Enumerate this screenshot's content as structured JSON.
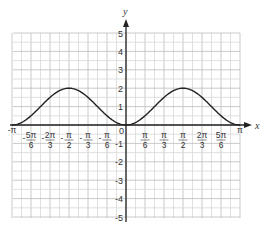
{
  "chart_data": {
    "type": "line",
    "title": "",
    "xlabel": "x",
    "ylabel": "y",
    "function": "y = 1 - cos(2x)",
    "xlim": [
      -3.14159,
      3.14159
    ],
    "ylim": [
      -5,
      5
    ],
    "grid": true,
    "x_ticks": [
      {
        "value": -3.14159,
        "label": "-π"
      },
      {
        "value": -2.61799,
        "label": "-5π/6",
        "num": "5π",
        "den": "6"
      },
      {
        "value": -2.0944,
        "label": "-2π/3",
        "num": "2π",
        "den": "3"
      },
      {
        "value": -1.5708,
        "label": "-π/2",
        "num": "π",
        "den": "2"
      },
      {
        "value": -1.0472,
        "label": "-π/3",
        "num": "π",
        "den": "3"
      },
      {
        "value": -0.5236,
        "label": "-π/6",
        "num": "π",
        "den": "6"
      },
      {
        "value": 0.5236,
        "label": "π/6",
        "num": "π",
        "den": "6"
      },
      {
        "value": 1.0472,
        "label": "π/3",
        "num": "π",
        "den": "3"
      },
      {
        "value": 1.5708,
        "label": "π/2",
        "num": "π",
        "den": "2"
      },
      {
        "value": 2.0944,
        "label": "2π/3",
        "num": "2π",
        "den": "3"
      },
      {
        "value": 2.61799,
        "label": "5π/6",
        "num": "5π",
        "den": "6"
      },
      {
        "value": 3.14159,
        "label": "π"
      }
    ],
    "y_ticks": [
      5,
      4,
      3,
      2,
      1,
      -1,
      -2,
      -3,
      -4,
      -5
    ],
    "origin_label": "0",
    "series": [
      {
        "name": "curve",
        "x": [
          -3.14159,
          -2.61799,
          -2.0944,
          -1.5708,
          -1.0472,
          -0.5236,
          0,
          0.5236,
          1.0472,
          1.5708,
          2.0944,
          2.61799,
          3.14159
        ],
        "y": [
          0,
          0.5,
          1.5,
          2,
          1.5,
          0.5,
          0,
          0.5,
          1.5,
          2,
          1.5,
          0.5,
          0
        ]
      }
    ]
  }
}
